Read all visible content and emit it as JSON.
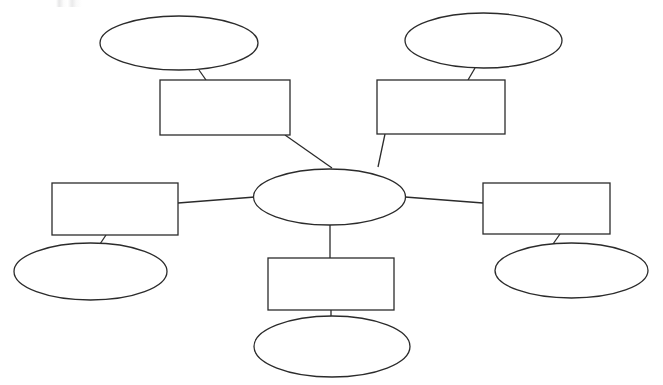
{
  "document": {
    "type": "concept-map-worksheet",
    "title": "",
    "background_color": "#ffffff",
    "stroke_color": "#2b2b2b",
    "fill_color": "#ffffff",
    "stroke_width": 1.3,
    "width": 663,
    "height": 385
  },
  "artifacts": {
    "top_edge_mark": ""
  },
  "nodes": {
    "center": {
      "label": "",
      "shape": "ellipse",
      "cx": 329.5,
      "cy": 197,
      "rx": 76,
      "ry": 28
    },
    "branches": [
      {
        "id": "top-left",
        "box": {
          "label": "",
          "shape": "rectangle",
          "x": 160,
          "y": 80,
          "width": 130,
          "height": 55
        },
        "bubble": {
          "label": "",
          "shape": "ellipse",
          "cx": 179,
          "cy": 43,
          "rx": 79,
          "ry": 27
        }
      },
      {
        "id": "top-right",
        "box": {
          "label": "",
          "shape": "rectangle",
          "x": 377,
          "y": 80,
          "width": 128,
          "height": 54
        },
        "bubble": {
          "label": "",
          "shape": "ellipse",
          "cx": 483.5,
          "cy": 40.5,
          "rx": 78.5,
          "ry": 27.5
        }
      },
      {
        "id": "left",
        "box": {
          "label": "",
          "shape": "rectangle",
          "x": 52,
          "y": 183,
          "width": 126,
          "height": 52
        },
        "bubble": {
          "label": "",
          "shape": "ellipse",
          "cx": 90.5,
          "cy": 271.5,
          "rx": 76.5,
          "ry": 28.5
        }
      },
      {
        "id": "right",
        "box": {
          "label": "",
          "shape": "rectangle",
          "x": 483,
          "y": 183,
          "width": 127,
          "height": 51
        },
        "bubble": {
          "label": "",
          "shape": "ellipse",
          "cx": 571.5,
          "cy": 270.5,
          "rx": 76.5,
          "ry": 27.5
        }
      },
      {
        "id": "bottom",
        "box": {
          "label": "",
          "shape": "rectangle",
          "x": 268,
          "y": 258,
          "width": 126,
          "height": 52
        },
        "bubble": {
          "label": "",
          "shape": "ellipse",
          "cx": 332,
          "cy": 346.5,
          "rx": 78,
          "ry": 30.5
        }
      }
    ]
  },
  "connectors": [
    {
      "id": "center-to-top-left-box",
      "points": "285,135 332,168"
    },
    {
      "id": "center-to-top-right-box",
      "points": "385,134 378,167"
    },
    {
      "id": "center-to-left-box",
      "points": "178,203 255,197"
    },
    {
      "id": "center-to-right-box",
      "points": "405,197 483,203"
    },
    {
      "id": "center-to-bottom-box",
      "points": "330,225 330,258"
    },
    {
      "id": "top-left-box-to-bubble",
      "points": "206,80 199,70"
    },
    {
      "id": "top-right-box-to-bubble",
      "points": "468,80 475,68"
    },
    {
      "id": "left-box-to-bubble",
      "points": "106,235 100,244"
    },
    {
      "id": "right-box-to-bubble",
      "points": "560,234 553,244"
    },
    {
      "id": "bottom-box-to-bubble",
      "points": "331,310 331,318"
    }
  ]
}
